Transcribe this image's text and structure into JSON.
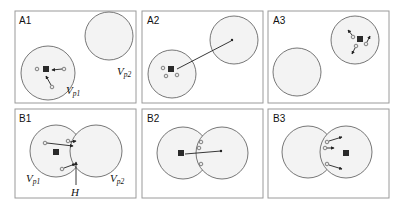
{
  "figure": {
    "colors": {
      "frame": "#9a9a9a",
      "region_fill": "#f3f3f3",
      "region_stroke": "#555555",
      "site": "#2a2a2a",
      "particle_fill": "#e8e8e8"
    },
    "panels": [
      {
        "id": "A1",
        "label": "A1",
        "annotations": {
          "vp1": "V",
          "vp1_sub": "p1",
          "vp2": "V",
          "vp2_sub": "p2"
        }
      },
      {
        "id": "A2",
        "label": "A2"
      },
      {
        "id": "A3",
        "label": "A3"
      },
      {
        "id": "B1",
        "label": "B1",
        "annotations": {
          "vp1": "V",
          "vp1_sub": "p1",
          "vp2": "V",
          "vp2_sub": "p2",
          "h": "H"
        }
      },
      {
        "id": "B2",
        "label": "B2"
      },
      {
        "id": "B3",
        "label": "B3"
      }
    ]
  }
}
